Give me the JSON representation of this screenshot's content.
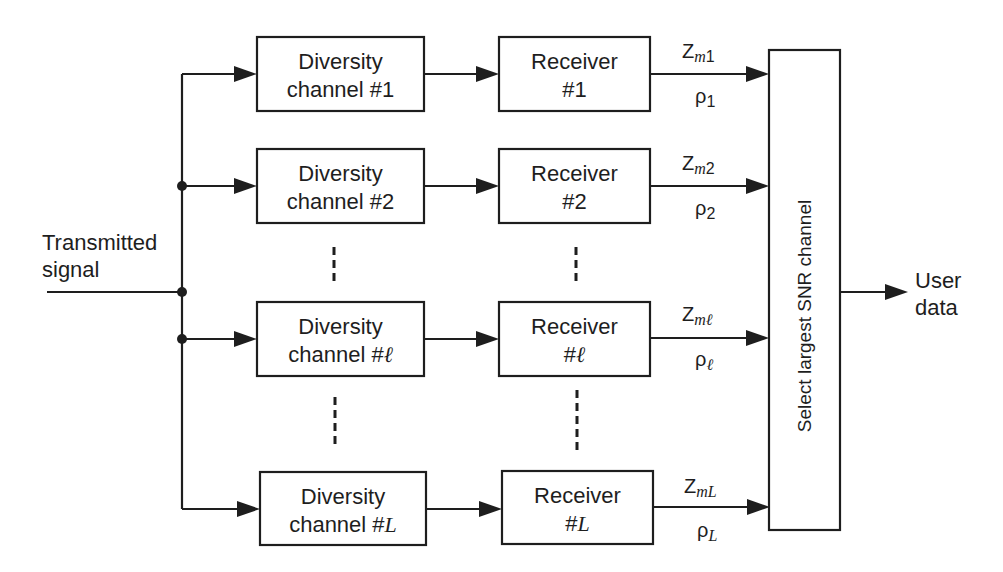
{
  "diagram": {
    "input_label": {
      "line1": "Transmitted",
      "line2": "signal"
    },
    "output_label": {
      "line1": "User",
      "line2": "data"
    },
    "combiner_label": "Select largest SNR channel",
    "branches": [
      {
        "channel_line1": "Diversity",
        "channel_line2": "channel #",
        "index": "1",
        "receiver_line1": "Receiver",
        "receiver_line2": "#",
        "output_symbol": "Z",
        "output_sub_var": "m",
        "output_sub_idx": "1",
        "snr_symbol": "ρ",
        "snr_sub": "1"
      },
      {
        "channel_line1": "Diversity",
        "channel_line2": "channel #",
        "index": "2",
        "receiver_line1": "Receiver",
        "receiver_line2": "#",
        "output_symbol": "Z",
        "output_sub_var": "m",
        "output_sub_idx": "2",
        "snr_symbol": "ρ",
        "snr_sub": "2"
      },
      {
        "channel_line1": "Diversity",
        "channel_line2": "channel #",
        "index": "ℓ",
        "receiver_line1": "Receiver",
        "receiver_line2": "#",
        "output_symbol": "Z",
        "output_sub_var": "m",
        "output_sub_idx": "ℓ",
        "snr_symbol": "ρ",
        "snr_sub": "ℓ"
      },
      {
        "channel_line1": "Diversity",
        "channel_line2": "channel #",
        "index": "L",
        "receiver_line1": "Receiver",
        "receiver_line2": "#",
        "output_symbol": "Z",
        "output_sub_var": "m",
        "output_sub_idx": "L",
        "snr_symbol": "ρ",
        "snr_sub": "L"
      }
    ],
    "colors": {
      "line": "#1e1e1e",
      "background": "#ffffff"
    }
  }
}
